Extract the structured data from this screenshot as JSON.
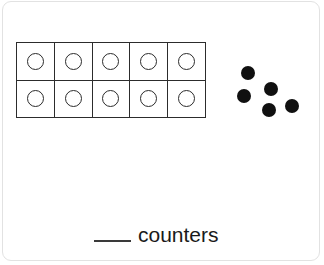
{
  "worksheet": {
    "type": "ten-frame-addition",
    "ten_frame": {
      "rows": 2,
      "columns": 5,
      "cells": [
        {
          "counter": "empty-circle"
        },
        {
          "counter": "empty-circle"
        },
        {
          "counter": "empty-circle"
        },
        {
          "counter": "empty-circle"
        },
        {
          "counter": "empty-circle"
        },
        {
          "counter": "empty-circle"
        },
        {
          "counter": "empty-circle"
        },
        {
          "counter": "empty-circle"
        },
        {
          "counter": "empty-circle"
        },
        {
          "counter": "empty-circle"
        }
      ],
      "filled_count": 0,
      "empty_count": 10,
      "total_cells": 10
    },
    "loose_counters": {
      "count": 5,
      "color": "#101010",
      "positions": [
        {
          "x": 13,
          "y": 6
        },
        {
          "x": 36,
          "y": 22
        },
        {
          "x": 9,
          "y": 29
        },
        {
          "x": 34,
          "y": 43
        },
        {
          "x": 57,
          "y": 39
        }
      ]
    },
    "equation": {
      "left_blank": "",
      "operator": "+",
      "right_blank": ""
    },
    "total": {
      "blank": "",
      "label": "counters"
    },
    "colors": {
      "ink": "#1a1a1a",
      "grid_line": "#2c2c2c",
      "counter_fill": "#101010",
      "card_border": "#e2e2e2",
      "background": "#ffffff"
    }
  }
}
